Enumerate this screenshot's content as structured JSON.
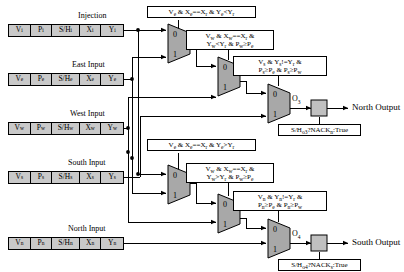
{
  "diagram": {
    "colors": {
      "register_fill": "#c9c9c9",
      "mux_fill": "#a8a8a8",
      "latch_fill": "#c0c0c0",
      "line": "#000000",
      "background": "#ffffff"
    }
  },
  "inputs": [
    {
      "title": "Injection",
      "cells": [
        {
          "label": "Vi",
          "name": "valid"
        },
        {
          "label": "Pi",
          "name": "priority"
        },
        {
          "label": "S/Hi",
          "name": "stop-hold"
        },
        {
          "label": "Xi",
          "name": "x-coord"
        },
        {
          "label": "Yi",
          "name": "y-coord"
        }
      ]
    },
    {
      "title": "East Input",
      "cells": [
        {
          "label": "Ve",
          "name": "valid"
        },
        {
          "label": "Pe",
          "name": "priority"
        },
        {
          "label": "S/He",
          "name": "stop-hold"
        },
        {
          "label": "Xe",
          "name": "x-coord"
        },
        {
          "label": "Ye",
          "name": "y-coord"
        }
      ]
    },
    {
      "title": "West Input",
      "cells": [
        {
          "label": "Vw",
          "name": "valid"
        },
        {
          "label": "Pw",
          "name": "priority"
        },
        {
          "label": "S/Hw",
          "name": "stop-hold"
        },
        {
          "label": "Xw",
          "name": "x-coord"
        },
        {
          "label": "Yw",
          "name": "y-coord"
        }
      ]
    },
    {
      "title": "South Input",
      "cells": [
        {
          "label": "Vs",
          "name": "valid"
        },
        {
          "label": "Ps",
          "name": "priority"
        },
        {
          "label": "S/Hs",
          "name": "stop-hold"
        },
        {
          "label": "Xs",
          "name": "x-coord"
        },
        {
          "label": "Ys",
          "name": "y-coord"
        }
      ]
    },
    {
      "title": "North Input",
      "cells": [
        {
          "label": "Vn",
          "name": "valid"
        },
        {
          "label": "Pn",
          "name": "priority"
        },
        {
          "label": "S/Hn",
          "name": "stop-hold"
        },
        {
          "label": "Xn",
          "name": "x-coord"
        },
        {
          "label": "Yn",
          "name": "y-coord"
        }
      ]
    }
  ],
  "north_chain": {
    "cond1": "Ve & Xe==Xr & Ye<Yr",
    "cond2_line1": "Vw & Xw==Xr &",
    "cond2_line2": "Yw<Yr & Pw≥Pe",
    "cond3_line1": "Vs & Ys!=Yr &",
    "cond3_line2": "Ps≥Pe & Ps≥Pw",
    "out_signal": "O3",
    "latch_cond": "S/Ho3?NACKn:True",
    "output_label": "North Output"
  },
  "south_chain": {
    "cond1": "Ve & Xe==Xr & Ye>Yr",
    "cond2_line1": "Vw & Xw==Xr &",
    "cond2_line2": "Yw>Yr & Pw≥Pe",
    "cond3_line1": "Vn & Yn!=Yr &",
    "cond3_line2": "Pn≥Pe & Pn≥Pw",
    "out_signal": "O4",
    "latch_cond": "S/Ho4?NACKs:True",
    "output_label": "South Output"
  },
  "mux_ports": {
    "sel0": "0",
    "sel1": "1"
  }
}
